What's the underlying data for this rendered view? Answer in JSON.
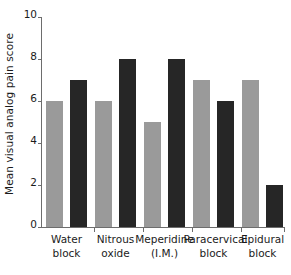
{
  "chart_data": {
    "type": "bar",
    "title": "",
    "subtitle": "",
    "xlabel": "",
    "ylabel": "Mean visual analog pain score",
    "ylim": [
      0,
      10
    ],
    "yticks": [
      0,
      2,
      4,
      6,
      8,
      10
    ],
    "ytick_labels": [
      "0",
      "2",
      "4",
      "6",
      "8",
      "10"
    ],
    "grid": false,
    "legend_position": "none",
    "categories": [
      "Water block",
      "Nitrous oxide",
      "Meperidine (I.M.)",
      "Paracervical block",
      "Epidural block"
    ],
    "category_lines": [
      [
        "Water",
        "block"
      ],
      [
        "Nitrous",
        "oxide"
      ],
      [
        "Meperidine",
        "(I.M.)"
      ],
      [
        "Paracervical",
        "block"
      ],
      [
        "Epidural",
        "block"
      ]
    ],
    "series": [
      {
        "name": "series-a",
        "color": "#9a9a9a",
        "values": [
          6,
          6,
          5,
          7,
          7
        ]
      },
      {
        "name": "series-b",
        "color": "#262626",
        "values": [
          7,
          8,
          8,
          6,
          2
        ]
      }
    ],
    "annotations": []
  },
  "colors": {
    "series_a": "#9a9a9a",
    "series_b": "#262626",
    "axis": "#6d6d6d",
    "text": "#1b1b1b",
    "background": "#ffffff"
  }
}
